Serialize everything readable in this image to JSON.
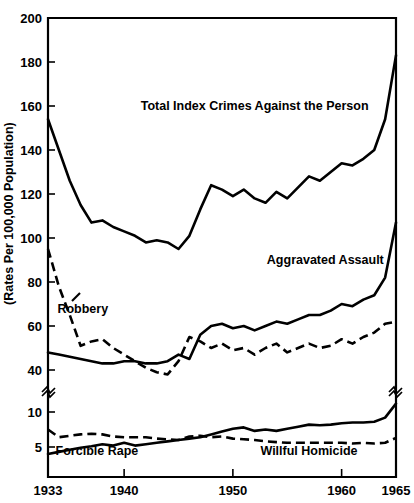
{
  "chart_data": {
    "type": "line",
    "title": "",
    "xlabel": "",
    "ylabel": "(Rates Per 100,000 Population)",
    "grid": false,
    "legend_position": "inline-annotations",
    "x": [
      1933,
      1934,
      1935,
      1936,
      1937,
      1938,
      1939,
      1940,
      1941,
      1942,
      1943,
      1944,
      1945,
      1946,
      1947,
      1948,
      1949,
      1950,
      1951,
      1952,
      1953,
      1954,
      1955,
      1956,
      1957,
      1958,
      1959,
      1960,
      1961,
      1962,
      1963,
      1964,
      1965
    ],
    "xlim": [
      1933,
      1965
    ],
    "xticks": [
      1933,
      1940,
      1950,
      1960,
      1965
    ],
    "xticklabels": [
      "1933",
      "1940",
      "1950",
      "1960",
      "1965"
    ],
    "yticks_upper": [
      200,
      180,
      160,
      140,
      120,
      100,
      80,
      60,
      40
    ],
    "yticks_lower": [
      10,
      5
    ],
    "ylim_upper": [
      40,
      200
    ],
    "ylim_lower": [
      3,
      12
    ],
    "axis_break": true,
    "axis_break_note": "broken y-axis between 40 and 10",
    "series": [
      {
        "name": "Total Index Crimes Against the Person",
        "style": "solid",
        "label_x": 1952,
        "label_y": 158,
        "scale": "upper",
        "values": [
          154,
          140,
          126,
          115,
          107,
          108,
          105,
          103,
          101,
          98,
          99,
          98,
          95,
          101,
          113,
          124,
          122,
          119,
          122,
          118,
          116,
          121,
          118,
          123,
          128,
          126,
          130,
          134,
          133,
          136,
          140,
          154,
          183
        ]
      },
      {
        "name": "Aggravated Assault",
        "style": "solid",
        "label_x": 1958.5,
        "label_y": 88,
        "scale": "upper",
        "values": [
          48,
          47,
          46,
          45,
          44,
          43,
          43,
          44,
          44,
          43,
          43,
          44,
          47,
          45,
          56,
          60,
          61,
          59,
          60,
          58,
          60,
          62,
          61,
          63,
          65,
          65,
          67,
          70,
          69,
          72,
          74,
          82,
          107
        ]
      },
      {
        "name": "Robbery",
        "style": "dashed",
        "label_x": 1936.2,
        "label_y": 66,
        "scale": "upper",
        "values": [
          95,
          78,
          65,
          51,
          53,
          54,
          50,
          47,
          44,
          41,
          39,
          38,
          44,
          55,
          53,
          50,
          52,
          49,
          50,
          47,
          50,
          52,
          48,
          50,
          52,
          50,
          51,
          54,
          52,
          55,
          57,
          61,
          62
        ]
      },
      {
        "name": "Forcible Rape",
        "style": "solid",
        "label_x": 1937.5,
        "label_y": 3.9,
        "scale": "lower",
        "values": [
          4.0,
          4.3,
          4.6,
          4.9,
          5.1,
          5.4,
          5.2,
          5.6,
          5.2,
          5.4,
          5.6,
          5.8,
          6.0,
          6.2,
          6.4,
          6.8,
          7.2,
          7.6,
          7.8,
          7.3,
          7.5,
          7.3,
          7.6,
          7.9,
          8.2,
          8.1,
          8.2,
          8.4,
          8.5,
          8.5,
          8.6,
          9.2,
          11.2
        ]
      },
      {
        "name": "Willful Homicide",
        "style": "dashed",
        "label_x": 1957,
        "label_y": 3.9,
        "scale": "lower",
        "values": [
          7.5,
          6.4,
          6.6,
          6.8,
          6.9,
          6.8,
          6.5,
          6.4,
          6.4,
          6.4,
          6.2,
          6.1,
          6.0,
          6.5,
          6.6,
          6.4,
          6.5,
          6.2,
          6.1,
          6.0,
          5.8,
          5.7,
          5.6,
          5.6,
          5.6,
          5.6,
          5.6,
          5.6,
          5.5,
          5.6,
          5.5,
          5.6,
          6.3
        ]
      }
    ]
  },
  "axis": {
    "y_axis_title": "(Rates Per 100,000 Population)",
    "y_tick_labels": [
      "200",
      "180",
      "160",
      "140",
      "120",
      "100",
      "80",
      "60",
      "40",
      "10",
      "5"
    ],
    "x_tick_labels": [
      "1933",
      "1940",
      "1950",
      "1960",
      "1965"
    ]
  },
  "annotations": {
    "total_index": "Total Index Crimes Against the Person",
    "aggravated_assault": "Aggravated Assault",
    "robbery": "Robbery",
    "forcible_rape": "Forcible Rape",
    "willful_homicide": "Willful Homicide"
  },
  "colors": {
    "ink": "#000000",
    "background": "#ffffff"
  }
}
